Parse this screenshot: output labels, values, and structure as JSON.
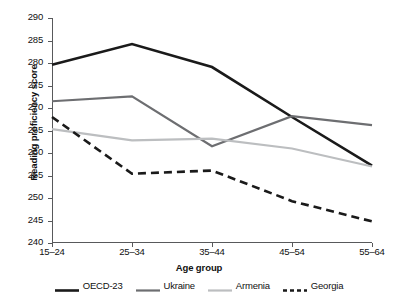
{
  "chart_data": {
    "type": "line",
    "title": "",
    "xlabel": "Age group",
    "ylabel": "Reading proficiency score",
    "categories": [
      "15–24",
      "25–34",
      "35–44",
      "45–54",
      "55–64"
    ],
    "ylim": [
      240,
      290
    ],
    "yticks": [
      240,
      245,
      250,
      255,
      260,
      265,
      270,
      275,
      280,
      285,
      290
    ],
    "grid": false,
    "legend_position": "bottom",
    "series": [
      {
        "name": "OECD-23",
        "values": [
          279.6,
          284.2,
          279.1,
          268.0,
          257.2
        ],
        "color": "#1a1a1a",
        "style": "solid",
        "width": 2.6
      },
      {
        "name": "Ukraine",
        "values": [
          271.5,
          272.6,
          261.5,
          268.2,
          266.2
        ],
        "color": "#6d6e71",
        "style": "solid",
        "width": 2.2
      },
      {
        "name": "Armenia",
        "values": [
          265.3,
          262.8,
          263.2,
          261.0,
          257.0
        ],
        "color": "#bcbec0",
        "style": "solid",
        "width": 2.2
      },
      {
        "name": "Georgia",
        "values": [
          268.0,
          255.4,
          256.1,
          249.3,
          244.8
        ],
        "color": "#1a1a1a",
        "style": "dashed",
        "width": 2.6
      }
    ]
  }
}
